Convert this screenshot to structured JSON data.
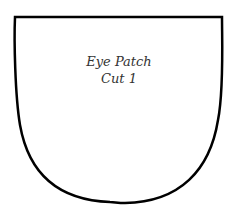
{
  "pattern": {
    "title": "Eye Patch",
    "instruction": "Cut 1",
    "stroke_color": "#000000",
    "fill_color": "#ffffff"
  }
}
